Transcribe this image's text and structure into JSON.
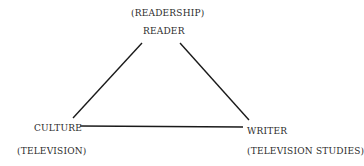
{
  "diagram": {
    "type": "triangle",
    "nodes": [
      {
        "id": "reader",
        "label": "READER",
        "sublabel": "(READERSHIP)"
      },
      {
        "id": "culture",
        "label": "CULTURE",
        "sublabel": "(TELEVISION)"
      },
      {
        "id": "writer",
        "label": "WRITER",
        "sublabel": "(TELEVISION STUDIES)"
      }
    ],
    "edges": [
      {
        "from": "culture",
        "to": "reader"
      },
      {
        "from": "reader",
        "to": "writer"
      },
      {
        "from": "culture",
        "to": "writer"
      }
    ],
    "colors": {
      "line": "#1a1a1a",
      "text": "#2b2b2b",
      "background": "#ffffff"
    }
  }
}
